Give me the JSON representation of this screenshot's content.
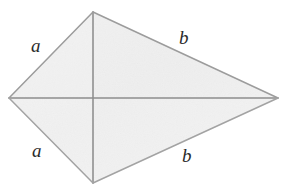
{
  "figure": {
    "name": "kite-quadrilateral",
    "background_color": "#ffffff",
    "fill_color": "#f1f1f1",
    "fill_color_light": "#f7f7f7",
    "edge_color": "#9a9a9a",
    "diagonal_color": "#8f8f8f",
    "label_color": "#2b2b2b",
    "vertices": {
      "top": {
        "x": 93,
        "y": 12
      },
      "left": {
        "x": 9,
        "y": 98
      },
      "bottom": {
        "x": 93,
        "y": 183
      },
      "right": {
        "x": 278,
        "y": 98
      }
    },
    "diagonals": [
      {
        "name": "vertical-diagonal",
        "from": "top",
        "to": "bottom"
      },
      {
        "name": "horizontal-diagonal",
        "from": "left",
        "to": "right"
      }
    ],
    "labels": [
      {
        "id": "a-upper",
        "text": "a",
        "side": "top-left"
      },
      {
        "id": "b-upper",
        "text": "b",
        "side": "top-right"
      },
      {
        "id": "a-lower",
        "text": "a",
        "side": "bottom-left"
      },
      {
        "id": "b-lower",
        "text": "b",
        "side": "bottom-right"
      }
    ]
  }
}
